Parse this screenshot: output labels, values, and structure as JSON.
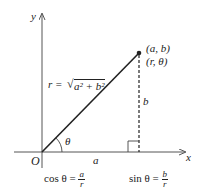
{
  "axes": {
    "x_label": "x",
    "y_label": "y",
    "origin_label": "O"
  },
  "point": {
    "cartesian": "(a, b)",
    "polar": "(r, θ)"
  },
  "segments": {
    "hypotenuse": "r = √a² + b²",
    "r_lhs": "r =",
    "sqrt_body": "a² + b²",
    "horizontal": "a",
    "vertical": "b",
    "angle": "θ"
  },
  "formulas": {
    "cos": {
      "lhs": "cos θ =",
      "num": "a",
      "den": "r"
    },
    "sin": {
      "lhs": "sin θ =",
      "num": "b",
      "den": "r"
    }
  },
  "colors": {
    "line": "#222222",
    "background": "#ffffff"
  }
}
